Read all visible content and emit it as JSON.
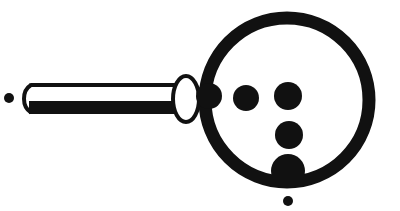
{
  "figure": {
    "title": "Magnifying glass with dots",
    "width": 400,
    "height": 211,
    "background_color": "#ffffff",
    "ink_color": "#111111",
    "stroke_color": "#111111"
  },
  "shapes": {
    "lens_ring": {
      "name": "lens-ring",
      "label": "Lens rim",
      "cx": 287,
      "cy": 100,
      "r": 82,
      "stroke_width": 13,
      "fill": "none",
      "stroke": "#111111"
    },
    "ferrule": {
      "name": "ferrule-ellipse",
      "label": "Ferrule",
      "cx": 186,
      "cy": 99,
      "rx": 13,
      "ry": 23,
      "fill": "#ffffff",
      "stroke": "#111111",
      "stroke_width": 4
    },
    "handle": {
      "name": "handle-bar",
      "label": "Handle",
      "x": 23,
      "y": 83,
      "width": 164,
      "height": 31,
      "radius": 7,
      "fill": "#ffffff",
      "stroke": "#111111",
      "stroke_top_width": 4,
      "stroke_bottom_width": 13
    },
    "dots": [
      {
        "name": "dot-lens-left",
        "label": "Dot 1",
        "cx": 209,
        "cy": 96,
        "r": 13,
        "fill": "#111111"
      },
      {
        "name": "dot-lens-center",
        "label": "Dot 2",
        "cx": 246,
        "cy": 98,
        "r": 13,
        "fill": "#111111"
      },
      {
        "name": "dot-lens-right",
        "label": "Dot 3",
        "cx": 288,
        "cy": 96,
        "r": 14,
        "fill": "#111111"
      },
      {
        "name": "dot-lens-middle-row",
        "label": "Dot 4",
        "cx": 289,
        "cy": 135,
        "r": 14,
        "fill": "#111111"
      },
      {
        "name": "dot-lens-bottom",
        "label": "Dot 5",
        "cx": 288,
        "cy": 171,
        "r": 17,
        "fill": "#111111"
      }
    ],
    "stray_dots": [
      {
        "name": "stray-dot-left",
        "label": "Stray dot left",
        "cx": 9,
        "cy": 98,
        "r": 5,
        "fill": "#111111"
      },
      {
        "name": "stray-dot-bottom",
        "label": "Stray dot bottom",
        "cx": 288,
        "cy": 201,
        "r": 5,
        "fill": "#111111"
      }
    ]
  }
}
